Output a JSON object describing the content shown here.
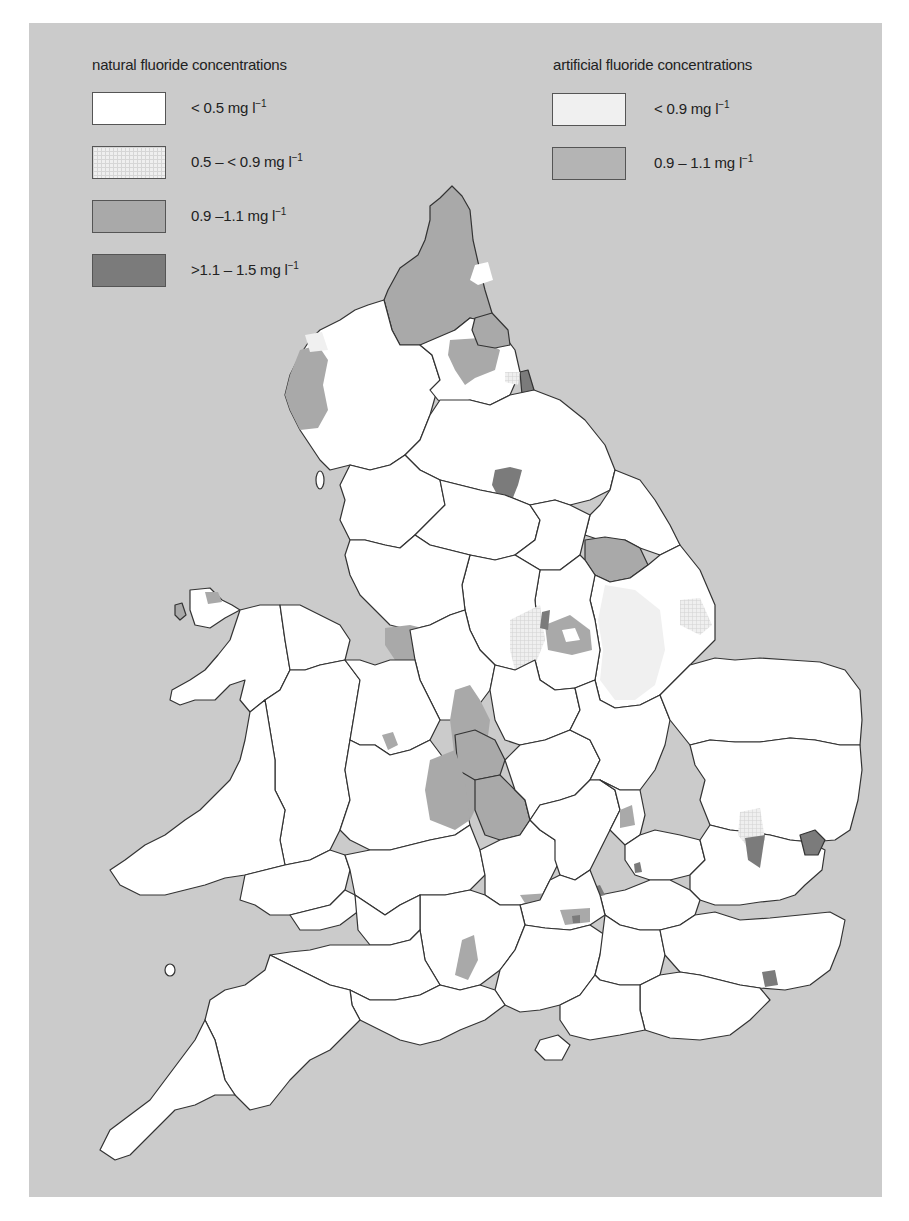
{
  "legend": {
    "natural": {
      "title": "natural fluoride concentrations",
      "items": [
        {
          "label": "< 0.5 mg l",
          "unit_exp": "−1",
          "color": "#ffffff"
        },
        {
          "label": "0.5 – < 0.9 mg l",
          "unit_exp": "−1",
          "color": "#ececec",
          "pattern": "hatched"
        },
        {
          "label": "0.9 –1.1 mg l",
          "unit_exp": "−1",
          "color": "#a9a9a9"
        },
        {
          "label": ">1.1 – 1.5 mg l",
          "unit_exp": "−1",
          "color": "#7b7b7b"
        }
      ]
    },
    "artificial": {
      "title": "artificial fluoride concentrations",
      "items": [
        {
          "label": "< 0.9 mg l",
          "unit_exp": "−1",
          "color": "#f0f0f0"
        },
        {
          "label": "0.9 – 1.1 mg l",
          "unit_exp": "−1",
          "color": "#b4b4b4"
        }
      ]
    }
  },
  "map": {
    "region": "England and Wales",
    "background_color": "#cbcbcb",
    "land_color": "#ffffff",
    "outline_color": "#333333"
  }
}
